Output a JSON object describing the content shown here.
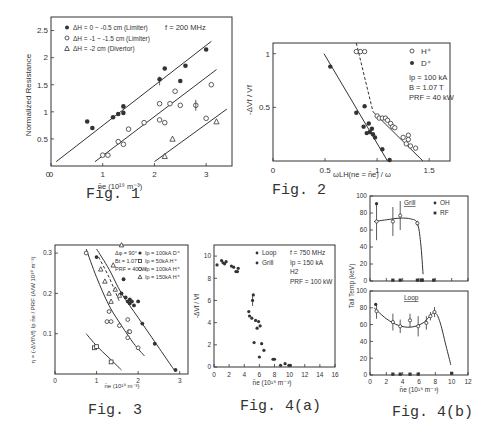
{
  "captions": {
    "fig1": "Fig. 1",
    "fig2": "Fig. 2",
    "fig3": "Fig. 3",
    "fig4a": "Fig. 4(a)",
    "fig4b": "Fig. 4(b)"
  },
  "chart_data": [
    {
      "id": "fig1",
      "type": "scatter",
      "title": "",
      "xlabel": "n̄e (10¹⁹ m⁻³)",
      "ylabel": "Normalized Resistance",
      "xlim": [
        0,
        3.5
      ],
      "ylim": [
        0,
        2.75
      ],
      "xticks": [
        0,
        1,
        2,
        3
      ],
      "yticks": [
        0.5,
        1,
        1.5,
        2,
        2.5
      ],
      "annotation": "f = 200 MHz",
      "legend": [
        {
          "marker": "filled-circle",
          "label": "ΔH = 0 ~ -0.5 cm   (Limiter)"
        },
        {
          "marker": "open-circle",
          "label": "ΔH = -1 ~ -1.5 cm  (Limiter)"
        },
        {
          "marker": "open-triangle",
          "label": "ΔH = -2 cm        (Divertor)"
        }
      ],
      "series": [
        {
          "name": "ΔH = 0 ~ -0.5 cm (Limiter)",
          "marker": "filled-circle",
          "x": [
            0.7,
            0.8,
            1.2,
            1.3,
            1.4,
            1.4,
            2.1,
            2.2,
            2.5,
            2.6,
            3.0
          ],
          "y": [
            0.82,
            0.7,
            0.9,
            0.96,
            0.98,
            1.1,
            1.6,
            1.8,
            1.57,
            1.85,
            2.15
          ]
        },
        {
          "name": "ΔH = -1 ~ -1.5 cm (Limiter)",
          "marker": "open-circle",
          "x": [
            1.0,
            1.1,
            1.3,
            1.4,
            1.5,
            1.8,
            2.1,
            2.1,
            2.2,
            2.3,
            2.4,
            2.5,
            2.8,
            3.0,
            3.1
          ],
          "y": [
            0.2,
            0.2,
            0.45,
            0.4,
            0.68,
            0.8,
            1.15,
            0.85,
            0.8,
            1.15,
            1.38,
            1.12,
            1.12,
            0.88,
            1.5
          ]
        },
        {
          "name": "ΔH = -2 cm (Divertor)",
          "marker": "open-triangle",
          "x": [
            2.2,
            2.35,
            3.2
          ],
          "y": [
            0.18,
            0.5,
            0.82
          ]
        }
      ],
      "fit_lines": [
        {
          "x": [
            0.1,
            3.1
          ],
          "y": [
            0.08,
            2.3
          ]
        },
        {
          "x": [
            0.85,
            3.2
          ],
          "y": [
            0.08,
            1.78
          ]
        },
        {
          "x": [
            2.0,
            3.4
          ],
          "y": [
            0.08,
            1.05
          ]
        }
      ]
    },
    {
      "id": "fig2",
      "type": "scatter",
      "title": "",
      "xlabel": "ωLH(ne = n̄e) / ω",
      "ylabel": "-ΔVf / Vf",
      "xlim": [
        0,
        1.7
      ],
      "ylim": [
        0,
        1.1
      ],
      "xticks": [
        0,
        0.5,
        1,
        1.5
      ],
      "yticks": [
        0.5,
        1.0
      ],
      "legend": [
        {
          "marker": "open-circle",
          "label": "H⁺"
        },
        {
          "marker": "filled-circle",
          "label": "D⁺"
        }
      ],
      "annotations": [
        "Ip = 100 kA",
        "B = 1.07 T",
        "PRF = 40 kW"
      ],
      "series": [
        {
          "name": "H+",
          "marker": "open-circle",
          "x": [
            0.8,
            0.84,
            0.88,
            1.0,
            1.02,
            1.05,
            1.08,
            1.1,
            1.13,
            1.15,
            1.17,
            1.25,
            1.28,
            1.3,
            1.3,
            1.32,
            1.37
          ],
          "y": [
            1.02,
            1.02,
            1.02,
            0.42,
            0.4,
            0.4,
            0.4,
            0.38,
            0.35,
            0.32,
            0.31,
            0.22,
            0.16,
            0.24,
            0.2,
            0.14,
            0.12
          ]
        },
        {
          "name": "D+",
          "marker": "filled-circle",
          "x": [
            0.55,
            0.8,
            0.87,
            0.88,
            0.9,
            0.92,
            0.93,
            0.95,
            0.96,
            0.98,
            1.05,
            1.12
          ],
          "y": [
            0.88,
            0.45,
            0.32,
            0.51,
            0.26,
            0.35,
            0.27,
            0.3,
            0.25,
            0.22,
            0.11,
            0.01
          ]
        }
      ],
      "fit_lines": [
        {
          "style": "solid",
          "x": [
            0.49,
            1.1
          ],
          "y": [
            1.0,
            0.0
          ]
        },
        {
          "style": "dashed",
          "x": [
            0.8,
            0.96
          ],
          "y": [
            1.1,
            0.46
          ]
        },
        {
          "style": "solid",
          "x": [
            0.96,
            1.44
          ],
          "y": [
            0.46,
            0.0
          ]
        }
      ]
    },
    {
      "id": "fig3",
      "type": "scatter",
      "title": "",
      "xlabel": "n̄e (10¹⁹ m⁻³)",
      "ylabel": "η = (-ΔVf/Vf) Ip n̄e / PRF (A/W 10¹⁹ m⁻³)",
      "xlim": [
        0,
        3.2
      ],
      "ylim": [
        0,
        0.32
      ],
      "xticks": [
        0,
        1,
        2,
        3
      ],
      "yticks": [
        0.1,
        0.2,
        0.3
      ],
      "annotations": [
        "Δφ = 90°",
        "Bt = 1.07T",
        "PRF = 40kW"
      ],
      "legend": [
        {
          "marker": "filled-circle",
          "label": "Ip = 100kA  D⁺"
        },
        {
          "marker": "open-square",
          "label": "Ip = 50kA  H⁺"
        },
        {
          "marker": "open-circle",
          "label": "Ip = 100kA  H⁺"
        },
        {
          "marker": "open-triangle",
          "label": "Ip = 150kA  H⁺"
        }
      ],
      "series": [
        {
          "name": "Ip=100kA D+",
          "marker": "filled-circle",
          "x": [
            1.0,
            1.6,
            1.65,
            1.7,
            1.75,
            1.8,
            1.8,
            1.85,
            1.9,
            2.0,
            2.1,
            2.4,
            2.9
          ],
          "y": [
            0.29,
            0.2,
            0.235,
            0.19,
            0.18,
            0.185,
            0.175,
            0.18,
            0.17,
            0.18,
            0.125,
            0.075,
            0.01
          ]
        },
        {
          "name": "Ip=50kA H+",
          "marker": "open-square",
          "x": [
            0.95,
            1.0,
            1.35
          ],
          "y": [
            0.065,
            0.068,
            0.03
          ]
        },
        {
          "name": "Ip=100kA H+",
          "marker": "open-circle",
          "x": [
            0.75,
            1.25,
            1.3,
            1.35,
            1.55,
            1.75,
            1.75,
            1.78,
            1.8,
            2.0
          ],
          "y": [
            0.3,
            0.13,
            0.155,
            0.13,
            0.12,
            0.135,
            0.09,
            0.105,
            0.105,
            0.065
          ]
        },
        {
          "name": "Ip=150kA H+",
          "marker": "open-triangle",
          "x": [
            1.1,
            1.2,
            1.3,
            1.35,
            1.4,
            1.45,
            1.55,
            1.6
          ],
          "y": [
            0.26,
            0.23,
            0.2,
            0.18,
            0.27,
            0.21,
            0.195,
            0.32
          ]
        }
      ],
      "fit_lines": [
        {
          "style": "solid",
          "x": [
            1.0,
            1.3,
            1.6,
            2.0,
            2.4,
            2.8,
            2.9
          ],
          "y": [
            0.31,
            0.26,
            0.2,
            0.14,
            0.08,
            0.02,
            0.005
          ]
        },
        {
          "style": "solid",
          "x": [
            0.75,
            1.0,
            1.3,
            1.6,
            1.9,
            2.15
          ],
          "y": [
            0.31,
            0.24,
            0.17,
            0.12,
            0.075,
            0.045
          ]
        },
        {
          "style": "dashed",
          "x": [
            1.05,
            1.3,
            1.55
          ],
          "y": [
            0.29,
            0.24,
            0.18
          ]
        },
        {
          "style": "solid",
          "x": [
            0.75,
            1.0,
            1.3,
            1.6
          ],
          "y": [
            0.1,
            0.07,
            0.04,
            0.01
          ]
        }
      ]
    },
    {
      "id": "fig4a",
      "type": "scatter",
      "title": "",
      "xlabel": "n̄e (10¹⁹ m⁻³)",
      "ylabel": "-ΔVf / Vf",
      "xlim": [
        0,
        16
      ],
      "ylim": [
        0,
        11
      ],
      "xticks": [
        0,
        2,
        4,
        6,
        8,
        10,
        12,
        14,
        16
      ],
      "yticks": [
        0,
        2,
        4,
        6,
        8,
        10
      ],
      "legend": [
        {
          "marker": "filled-circle",
          "label": "Loop"
        },
        {
          "marker": "filled-circle",
          "label": "Grill"
        }
      ],
      "annotations": [
        "f = 750 MHz",
        "Ip = 150 kA",
        "H2",
        "PRF = 100 kW"
      ],
      "series": [
        {
          "name": "Loop/Grill",
          "marker": "filled-circle",
          "x": [
            0.4,
            1.0,
            1.2,
            1.4,
            1.6,
            2.3,
            2.6,
            2.9,
            3.1,
            3.2,
            4.6,
            4.7,
            5.0,
            5.1,
            5.2,
            5.3,
            5.5,
            5.7,
            5.9,
            6.0,
            6.1,
            6.3,
            6.6,
            7.8,
            8.0,
            8.8,
            9.4,
            9.9,
            10.1
          ],
          "y": [
            9.2,
            9.6,
            9.4,
            9.3,
            9.5,
            9.1,
            9.0,
            8.6,
            8.6,
            8.9,
            5.0,
            4.6,
            4.4,
            6.0,
            6.5,
            2.2,
            4.2,
            3.5,
            4.1,
            0.9,
            3.7,
            2.1,
            1.5,
            0.7,
            0.7,
            0.15,
            0.3,
            0.15,
            0.15
          ]
        }
      ]
    },
    {
      "id": "fig4b",
      "type": "scatter",
      "title": "",
      "xlabel": "n̄e (10¹⁹ m⁻³)",
      "ylabel": "Tail Temp (keV)",
      "xlim": [
        0,
        12
      ],
      "ylim": [
        0,
        100
      ],
      "xticks": [
        0,
        2,
        4,
        6,
        8,
        10,
        12
      ],
      "yticks": [
        0,
        20,
        40,
        60,
        80,
        100
      ],
      "legend": [
        {
          "marker": "filled-circle",
          "label": "OH"
        },
        {
          "marker": "filled-square",
          "label": "RF"
        }
      ],
      "panels": [
        {
          "name": "Grill",
          "series": [
            {
              "name": "OH",
              "marker": "filled-circle",
              "x": [
                0.8
              ],
              "y": [
                91
              ]
            },
            {
              "name": "RF",
              "marker": "open-circle",
              "x": [
                0.8,
                2.8,
                3.7,
                5.8
              ],
              "y": [
                70,
                70,
                77,
                68
              ],
              "yerr": [
                22,
                17,
                17,
                3
              ]
            },
            {
              "name": "RF-zero",
              "marker": "filled-square",
              "x": [
                2.8,
                3.7,
                5.8,
                6.3,
                6.4,
                7.8
              ],
              "y": [
                1,
                1,
                1,
                1,
                1,
                1
              ]
            }
          ],
          "fit": {
            "x": [
              0.5,
              2,
              3.7,
              5,
              5.8,
              6.2,
              6.5
            ],
            "y": [
              70,
              72,
              74,
              73,
              68,
              45,
              8
            ]
          }
        },
        {
          "name": "Loop",
          "series": [
            {
              "name": "OH",
              "marker": "filled-circle",
              "x": [
                0.7
              ],
              "y": [
                84
              ]
            },
            {
              "name": "RF",
              "marker": "open-circle",
              "x": [
                0.8,
                2.8,
                3.7,
                4.9,
                5.9,
                6.9,
                7.4,
                7.9
              ],
              "y": [
                76,
                63,
                58,
                65,
                58,
                62,
                70,
                75
              ],
              "yerr": [
                9,
                10,
                8,
                8,
                12,
                8,
                5,
                6
              ]
            },
            {
              "name": "RF-zero",
              "marker": "filled-square",
              "x": [
                2.8,
                3.7,
                4.9,
                5.9,
                10.0
              ],
              "y": [
                1,
                1,
                1,
                1,
                2
              ]
            }
          ],
          "fit": {
            "x": [
              0.5,
              2,
              3.5,
              5,
              6.5,
              7.8,
              8.5,
              9.3,
              9.9
            ],
            "y": [
              80,
              67,
              59,
              57,
              62,
              74,
              65,
              35,
              12
            ]
          }
        }
      ]
    }
  ]
}
